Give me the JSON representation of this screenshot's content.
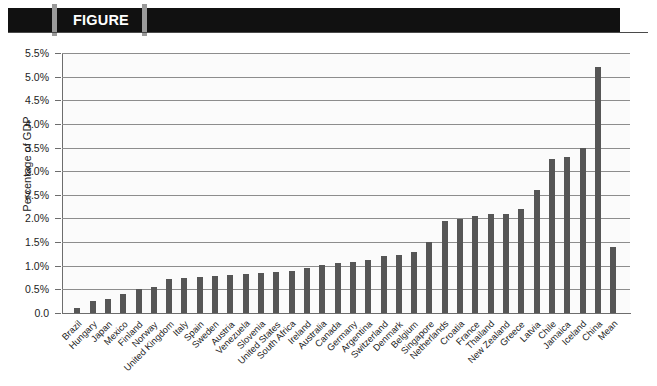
{
  "header": {
    "figure_label": "FIGURE 9.3",
    "title": "INFORMAL INVESTMENT AS A PERCENTAGE OF GDP"
  },
  "colors": {
    "bar": "#565656",
    "banner": "#111111",
    "banner_tick": "#9a9a9a",
    "gridline": "#8d8d8d",
    "axis": "#6d6d6d",
    "plot_background": "#fbfbfb",
    "figure_label_text": "#ffffff",
    "title_text": "#111111"
  },
  "chart_data": {
    "type": "bar",
    "title": "INFORMAL INVESTMENT AS A PERCENTAGE OF GDP",
    "xlabel": "",
    "ylabel": "Percentage of GDP",
    "ylim": [
      0,
      5.5
    ],
    "ytick_labels": [
      "5.5%",
      "5.0%",
      "4.5%",
      "4.0%",
      "3.5%",
      "3.0%",
      "2.5%",
      "2.0%",
      "1.5%",
      "1.0%",
      "0.5%",
      "0.0"
    ],
    "ytick_values": [
      5.5,
      5.0,
      4.5,
      4.0,
      3.5,
      3.0,
      2.5,
      2.0,
      1.5,
      1.0,
      0.5,
      0.0
    ],
    "grid": true,
    "legend": false,
    "categories": [
      "Brazil",
      "Hungary",
      "Japan",
      "Mexico",
      "Finland",
      "Norway",
      "United Kingdom",
      "Italy",
      "Spain",
      "Sweden",
      "Austria",
      "Venezuela",
      "Slovenia",
      "United States",
      "South Africa",
      "Ireland",
      "Australia",
      "Canada",
      "Germany",
      "Argentina",
      "Switzerland",
      "Denmark",
      "Belgium",
      "Singapore",
      "Netherlands",
      "Croatia",
      "France",
      "Thailand",
      "New Zealand",
      "Greece",
      "Latvia",
      "Chile",
      "Jamaica",
      "Iceland",
      "China",
      "Mean"
    ],
    "values": [
      0.1,
      0.25,
      0.3,
      0.4,
      0.5,
      0.55,
      0.72,
      0.74,
      0.76,
      0.78,
      0.8,
      0.82,
      0.85,
      0.86,
      0.88,
      0.95,
      1.02,
      1.05,
      1.08,
      1.12,
      1.2,
      1.22,
      1.28,
      1.5,
      1.95,
      1.98,
      2.05,
      2.1,
      2.1,
      2.2,
      2.6,
      3.25,
      3.3,
      3.5,
      5.2,
      1.4
    ]
  }
}
